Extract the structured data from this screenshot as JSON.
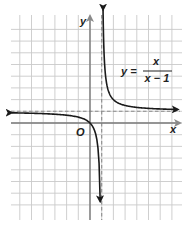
{
  "figure": {
    "equation": {
      "lhs": "y =",
      "numerator": "x",
      "denominator": "x − 1"
    },
    "axis_labels": {
      "x": "x",
      "y": "y"
    },
    "origin_label": "O",
    "asymptotes": {
      "vertical": "x = 1",
      "horizontal": "y = 1"
    },
    "grid": {
      "x_range": [
        -6,
        7
      ],
      "y_range": [
        -7,
        8
      ],
      "unit_px": 11.7
    },
    "colors": {
      "curve": "#1a1a1a",
      "axis": "#7a7a7a",
      "grid": "#c9c9c9",
      "asymptote": "#8a8a8a"
    }
  },
  "chart_data": {
    "type": "line",
    "xlabel": "x",
    "ylabel": "y",
    "xlim": [
      -6,
      7
    ],
    "ylim": [
      -7,
      8
    ],
    "grid": true,
    "asymptotes": {
      "vertical_x": 1,
      "horizontal_y": 1
    },
    "series": [
      {
        "name": "left branch (x < 1)",
        "x": [
          -6.5,
          -4,
          -2,
          -1,
          0,
          0.5,
          0.8,
          0.875
        ],
        "y": [
          0.87,
          0.8,
          0.67,
          0.5,
          0,
          -1,
          -4,
          -7
        ]
      },
      {
        "name": "right branch (x > 1)",
        "x": [
          1.125,
          1.2,
          1.5,
          2,
          3,
          5,
          7
        ],
        "y": [
          9,
          6,
          3,
          2,
          1.5,
          1.25,
          1.17
        ]
      }
    ]
  }
}
